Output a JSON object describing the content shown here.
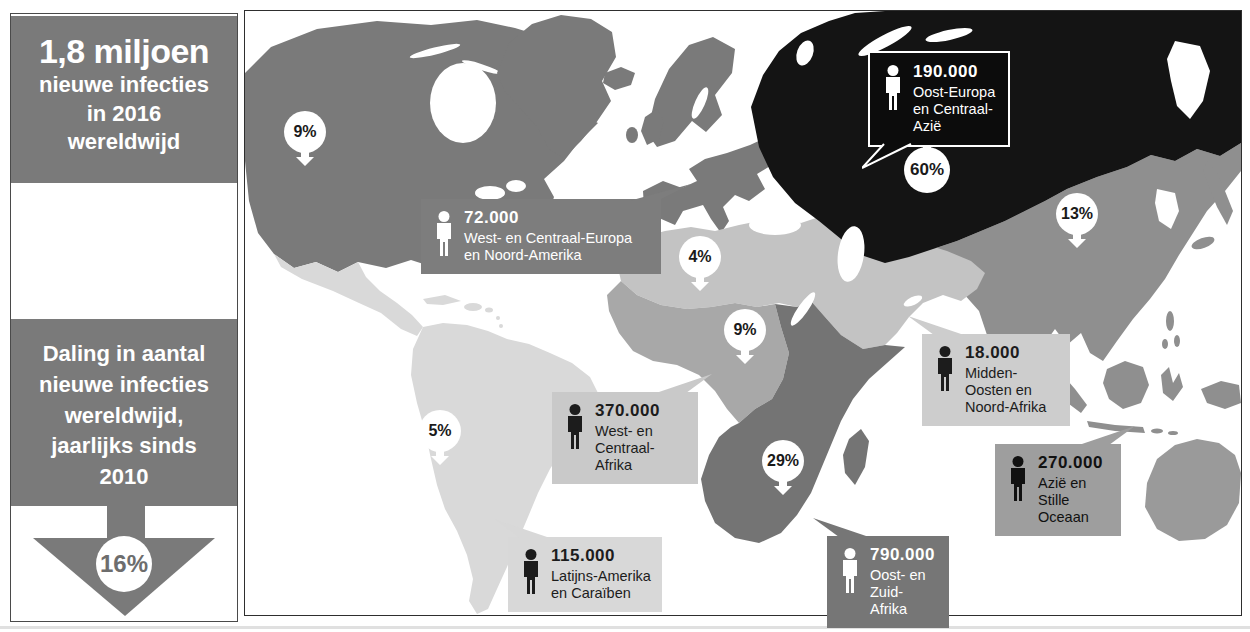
{
  "sidebar": {
    "headline_lines": [
      "1,8 miljoen",
      "nieuwe infecties",
      "in 2016",
      "wereldwijd"
    ],
    "decline_lines": [
      "Daling in aantal",
      "nieuwe infecties",
      "wereldwijd,",
      "jaarlijks sinds",
      "2010"
    ],
    "decline_percent": "16%"
  },
  "map": {
    "badges": [
      {
        "id": "north-america",
        "percent": "9%",
        "direction": "down"
      },
      {
        "id": "eastern-europe-central-asia",
        "percent": "60%",
        "direction": "up"
      },
      {
        "id": "asia",
        "percent": "13%",
        "direction": "down"
      },
      {
        "id": "north-africa",
        "percent": "4%",
        "direction": "down"
      },
      {
        "id": "central-africa",
        "percent": "9%",
        "direction": "down"
      },
      {
        "id": "southern-africa",
        "percent": "29%",
        "direction": "down"
      },
      {
        "id": "south-america",
        "percent": "5%",
        "direction": "down"
      }
    ],
    "callouts": [
      {
        "value": "72.000",
        "region": "West- en Centraal-Europa en Noord-Amerika",
        "bg": "#7d7d7d",
        "fg": "#ffffff"
      },
      {
        "value": "190.000",
        "region": "Oost-Europa en Centraal-Azië",
        "bg": "#0c0c0c",
        "fg": "#ffffff"
      },
      {
        "value": "18.000",
        "region": "Midden-Oosten en Noord-Afrika",
        "bg": "#cdcdcd",
        "fg": "#1c1c1c"
      },
      {
        "value": "370.000",
        "region": "West- en Centraal-Afrika",
        "bg": "#c9c9c9",
        "fg": "#1c1c1c"
      },
      {
        "value": "270.000",
        "region": "Azië en Stille Oceaan",
        "bg": "#9e9e9e",
        "fg": "#111111"
      },
      {
        "value": "790.000",
        "region": "Oost- en Zuid-Afrika",
        "bg": "#767676",
        "fg": "#ffffff"
      },
      {
        "value": "115.000",
        "region": "Latijns-Amerika en Caraïben",
        "bg": "#d8d8d8",
        "fg": "#1c1c1c"
      }
    ]
  },
  "colors": {
    "panel_gray": "#7a7a7a",
    "north_america": "#7a7a7a",
    "greenland": "#7a7a7a",
    "west_central_europe": "#7a7a7a",
    "eastern_europe_central_asia": "#141414",
    "asia_pacific": "#8f8f8f",
    "australia": "#9a9a9a",
    "middle_east_north_africa": "#c3c3c3",
    "west_central_africa": "#a8a8a8",
    "east_south_africa": "#747474",
    "latin_america": "#d9d9d9",
    "badge_circle": "#ffffff",
    "badge_text": "#1a1a1a",
    "decline_percent_text": "#6d6d6d"
  }
}
